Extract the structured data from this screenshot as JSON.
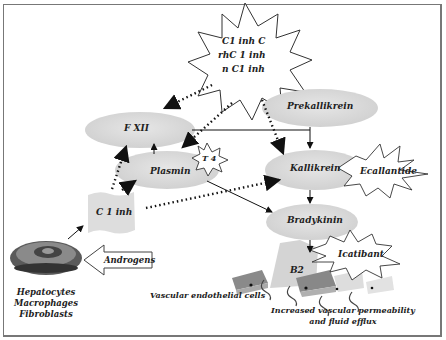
{
  "diagram": {
    "nodes": {
      "inhibitors_burst": [
        "C1 inh C",
        "rhC 1 inh",
        "n C1 inh"
      ],
      "fxii": "F XII",
      "prekallikrein": "Prekallikrein",
      "plasmin": "Plasmin",
      "t4": "T 4",
      "kallikrein": "Kallikrein",
      "ecallantide": "Ecallantide",
      "c1inh": "C 1 inh",
      "bradykinin": "Bradykinin",
      "icatibant": "Icatibant",
      "b2": "B2",
      "androgens": "Androgens",
      "cell_types": [
        "Hepatocytes",
        "Macrophages",
        "Fibroblasts"
      ],
      "endothelial": "Vascular endothelial cells",
      "outcome": [
        "Increased vascular permeability",
        "and fluid efflux"
      ]
    },
    "edges": [
      {
        "from": "C1 inh (burst)",
        "to": "F XII",
        "style": "dotted"
      },
      {
        "from": "C1 inh (burst)",
        "to": "Plasmin",
        "style": "dotted"
      },
      {
        "from": "C1 inh (burst)",
        "to": "Kallikrein",
        "style": "dotted"
      },
      {
        "from": "F XII",
        "to": "Kallikrein",
        "style": "solid"
      },
      {
        "from": "Prekallikrein",
        "to": "Kallikrein",
        "style": "solid"
      },
      {
        "from": "Plasmin",
        "to": "F XII",
        "style": "solid"
      },
      {
        "from": "Plasmin",
        "to": "Bradykinin",
        "style": "solid"
      },
      {
        "from": "Kallikrein",
        "to": "Bradykinin",
        "style": "solid"
      },
      {
        "from": "C 1 inh",
        "to": "F XII",
        "style": "dotted"
      },
      {
        "from": "C 1 inh",
        "to": "Plasmin",
        "style": "dotted"
      },
      {
        "from": "C 1 inh",
        "to": "Kallikrein",
        "style": "dotted"
      },
      {
        "from": "Hepatocytes",
        "to": "C 1 inh",
        "style": "solid"
      },
      {
        "from": "Androgens",
        "to": "Hepatocytes",
        "style": "block-arrow"
      },
      {
        "from": "Bradykinin",
        "to": "B2",
        "style": "solid"
      }
    ]
  }
}
